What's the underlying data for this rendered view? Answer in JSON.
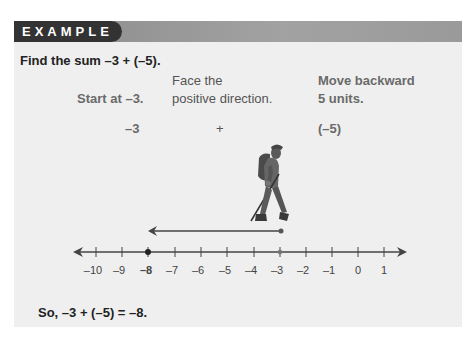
{
  "header": {
    "label": "EXAMPLE"
  },
  "problem": {
    "text": "Find the sum –3 + (–5)."
  },
  "steps": [
    {
      "lines": [
        "",
        "Start at –3."
      ],
      "symbol": "–3",
      "style": "bold-gray"
    },
    {
      "lines": [
        "Face the",
        "positive direction."
      ],
      "symbol": "+",
      "style": "normal"
    },
    {
      "lines": [
        "Move backward",
        "5 units."
      ],
      "symbol": "(–5)",
      "style": "bold-gray"
    }
  ],
  "number_line": {
    "min": -10,
    "max": 1,
    "tick_labels": [
      "–10",
      "–9",
      "–8",
      "–7",
      "–6",
      "–5",
      "–4",
      "–3",
      "–2",
      "–1",
      "0",
      "1"
    ],
    "start_point": -3,
    "end_point": -8,
    "highlighted_label": "–8",
    "movement_arrow": {
      "from": -3,
      "to": -8
    }
  },
  "figure": {
    "icon": "hiker-icon"
  },
  "conclusion": {
    "text": "So, –3 + (–5) = –8."
  },
  "colors": {
    "panel_bg": "#efefef",
    "header_dark": "#333333",
    "header_bar": "#9a9a9a"
  }
}
